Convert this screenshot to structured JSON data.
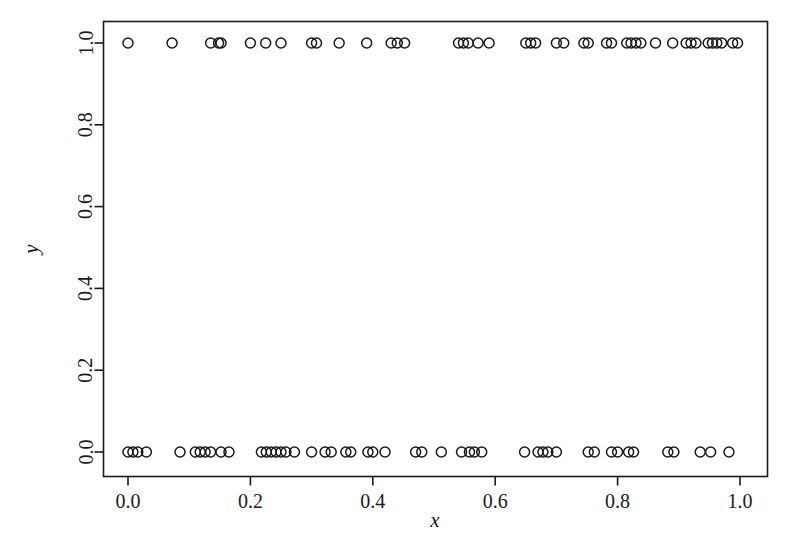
{
  "chart_data": {
    "type": "scatter",
    "title": "",
    "subtitle": "",
    "xlabel": "x",
    "ylabel": "y",
    "xlim": [
      -0.04,
      1.04
    ],
    "ylim": [
      -0.04,
      1.04
    ],
    "xticks": [
      0.0,
      0.2,
      0.4,
      0.6,
      0.8,
      1.0
    ],
    "yticks": [
      0.0,
      0.2,
      0.4,
      0.6,
      0.8,
      1.0
    ],
    "xtick_labels": [
      "0.0",
      "0.2",
      "0.4",
      "0.6",
      "0.8",
      "1.0"
    ],
    "ytick_labels": [
      "0.0",
      "0.2",
      "0.4",
      "0.6",
      "0.8",
      "1.0"
    ],
    "grid": false,
    "legend": null,
    "marker": "open-circle",
    "marker_size": 5,
    "marker_color": "#1a1a1a",
    "annotations": [],
    "series": [
      {
        "name": "observations",
        "x": [
          0.0,
          0.072,
          0.135,
          0.148,
          0.152,
          0.2,
          0.225,
          0.25,
          0.3,
          0.308,
          0.345,
          0.39,
          0.43,
          0.44,
          0.452,
          0.54,
          0.548,
          0.556,
          0.572,
          0.59,
          0.65,
          0.658,
          0.666,
          0.7,
          0.712,
          0.745,
          0.752,
          0.782,
          0.79,
          0.815,
          0.822,
          0.83,
          0.838,
          0.862,
          0.89,
          0.912,
          0.92,
          0.928,
          0.948,
          0.955,
          0.962,
          0.97,
          0.988,
          0.996
        ],
        "y": [
          1,
          1,
          1,
          1,
          1,
          1,
          1,
          1,
          1,
          1,
          1,
          1,
          1,
          1,
          1,
          1,
          1,
          1,
          1,
          1,
          1,
          1,
          1,
          1,
          1,
          1,
          1,
          1,
          1,
          1,
          1,
          1,
          1,
          1,
          1,
          1,
          1,
          1,
          1,
          1,
          1,
          1,
          1,
          1
        ]
      },
      {
        "name": "observations-zero",
        "x": [
          0.0,
          0.008,
          0.016,
          0.03,
          0.085,
          0.11,
          0.118,
          0.126,
          0.135,
          0.152,
          0.165,
          0.218,
          0.226,
          0.234,
          0.242,
          0.25,
          0.258,
          0.272,
          0.3,
          0.322,
          0.332,
          0.356,
          0.364,
          0.392,
          0.4,
          0.42,
          0.47,
          0.48,
          0.512,
          0.545,
          0.558,
          0.566,
          0.578,
          0.648,
          0.67,
          0.678,
          0.686,
          0.7,
          0.752,
          0.762,
          0.79,
          0.8,
          0.818,
          0.826,
          0.882,
          0.892,
          0.935,
          0.952,
          0.982
        ],
        "y": [
          0,
          0,
          0,
          0,
          0,
          0,
          0,
          0,
          0,
          0,
          0,
          0,
          0,
          0,
          0,
          0,
          0,
          0,
          0,
          0,
          0,
          0,
          0,
          0,
          0,
          0,
          0,
          0,
          0,
          0,
          0,
          0,
          0,
          0,
          0,
          0,
          0,
          0,
          0,
          0,
          0,
          0,
          0,
          0,
          0,
          0,
          0,
          0,
          0
        ]
      }
    ]
  }
}
